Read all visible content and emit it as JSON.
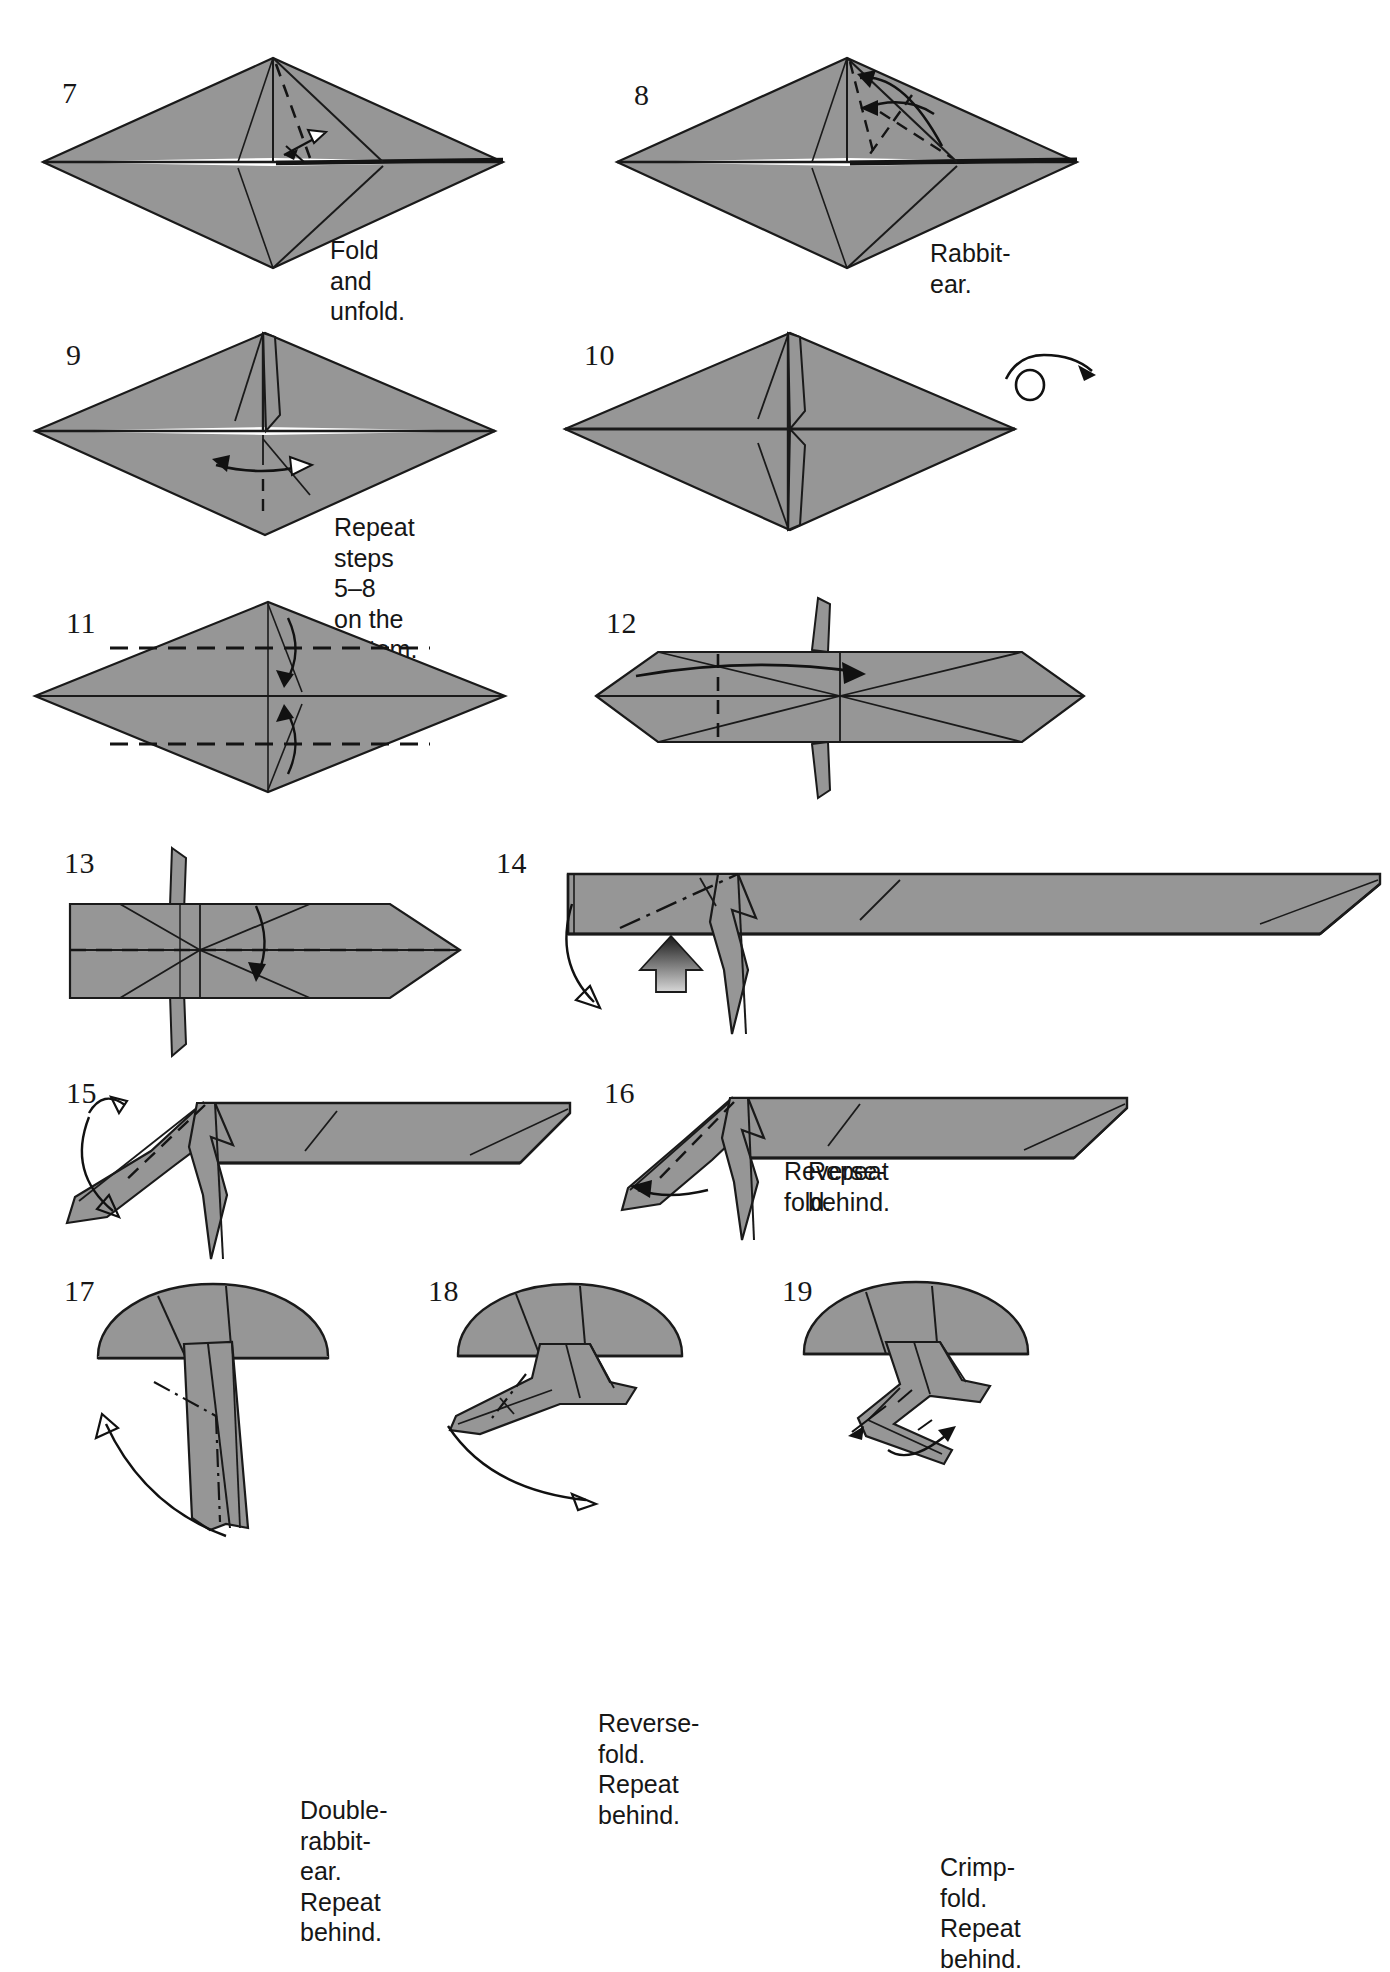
{
  "page": {
    "kind": "origami-instruction-diagram",
    "background_color": "#ffffff",
    "paper_fill": "#969696",
    "paper_fill_dark": "#7c7c7c",
    "line_color": "#1a1a1a",
    "white_paper": "#ffffff"
  },
  "steps": [
    {
      "number": "7",
      "caption": "Fold and unfold.",
      "shape": "diamond",
      "notes": "valley fold marked with dashed line and fold-and-unfold double arrow"
    },
    {
      "number": "8",
      "caption": "Rabbit-ear.",
      "shape": "diamond",
      "notes": "dashed crease lines with curved rabbit-ear arrows at upper right"
    },
    {
      "number": "9",
      "caption": "Repeat steps 5–8\non the bottom.",
      "shape": "diamond",
      "notes": "double-headed repeat arrow across lower half"
    },
    {
      "number": "10",
      "caption": "",
      "shape": "diamond",
      "notes": "completed diamond with flaps top and bottom; turn-over symbol at right"
    },
    {
      "number": "11",
      "caption": "",
      "shape": "diamond",
      "notes": "two horizontal dashed valley folds with arrows folding toward center"
    },
    {
      "number": "12",
      "caption": "",
      "shape": "hexagon",
      "notes": "vertical dashed fold with arrow pointing right; spikes above and below"
    },
    {
      "number": "13",
      "caption": "",
      "shape": "arrow-block",
      "notes": "horizontal dashed fold line with arrow folding downward"
    },
    {
      "number": "14",
      "caption": "Reverse-fold.",
      "shape": "long-bar",
      "notes": "dash-dot reverse-fold line, push arrow from below, curved arrow at left"
    },
    {
      "number": "15",
      "caption": "",
      "shape": "long-bar",
      "notes": "dashed fold on head flap with curved arrows"
    },
    {
      "number": "16",
      "caption": "Repeat behind.",
      "shape": "long-bar",
      "notes": "dashed fold with curved arrow to the left"
    },
    {
      "number": "17",
      "caption": "Double-rabbit-ear.\nRepeat behind.",
      "shape": "dome-with-legs",
      "notes": "dash-dot lines on legs with long curved arrow"
    },
    {
      "number": "18",
      "caption": "Reverse-fold.\nRepeat behind.",
      "shape": "dome-with-legs",
      "notes": "dash-dot reverse fold on leg, curved arrow"
    },
    {
      "number": "19",
      "caption": "Crimp-fold.\nRepeat behind.",
      "shape": "dome-with-legs",
      "notes": "crimp fold arrows on foot"
    }
  ],
  "symbols": {
    "turn_over": "turn-over-icon",
    "valley_fold": "dashed-line",
    "reverse_fold": "dash-dot-line",
    "push_arrow": "solid-gradient-arrow",
    "fold_arrow": "curved-arrow",
    "fold_unfold_arrow": "double-headed-arrow"
  }
}
